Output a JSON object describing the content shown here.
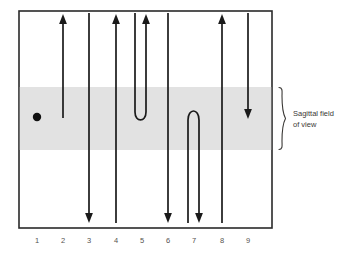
{
  "figure": {
    "background_color": "#ffffff",
    "frame": {
      "x": 19,
      "y": 11,
      "width": 253,
      "height": 217,
      "border_color": "#2a2a2a",
      "fill_color": "#ffffff"
    },
    "band": {
      "label_line1": "Sagittal field",
      "label_line2": "of view",
      "color": "#e2e2e2",
      "top": 87,
      "bottom": 150
    },
    "marker": {
      "name": "point-marker",
      "color": "#111111",
      "cx": 37,
      "cy": 117,
      "r": 4.2
    },
    "brace": {
      "color": "#3a3835",
      "x": 281,
      "top": 87,
      "bottom": 150
    },
    "axis_numbers": [
      {
        "label": "1",
        "x": 37
      },
      {
        "label": "2",
        "x": 63
      },
      {
        "label": "3",
        "x": 89
      },
      {
        "label": "4",
        "x": 116
      },
      {
        "label": "5",
        "x": 142
      },
      {
        "label": "6",
        "x": 168
      },
      {
        "label": "7",
        "x": 194
      },
      {
        "label": "8",
        "x": 222
      },
      {
        "label": "9",
        "x": 248
      }
    ],
    "axis_numbers_y": 243,
    "trajectories": [
      {
        "id": "1",
        "name": "trajectory-1-point",
        "type": "point",
        "description": "single stationary point inside the sagittal band",
        "x": 37,
        "y": 117
      },
      {
        "id": "2",
        "name": "trajectory-2-up-short",
        "type": "line",
        "description": "upward arrow from inside band to top of frame",
        "x": 63,
        "start_y": 118,
        "end_y": 17,
        "direction": "up",
        "arrow_at": "top"
      },
      {
        "id": "3",
        "name": "trajectory-3-down-full",
        "type": "line",
        "description": "downward arrow spanning full frame height",
        "x": 89,
        "start_y": 14,
        "end_y": 222,
        "direction": "down",
        "arrow_at": "bottom"
      },
      {
        "id": "4",
        "name": "trajectory-4-up-full",
        "type": "line",
        "description": "upward arrow spanning full frame height",
        "x": 116,
        "start_y": 222,
        "end_y": 17,
        "direction": "up",
        "arrow_at": "top"
      },
      {
        "id": "5",
        "name": "trajectory-5-u-turn-down-up",
        "type": "u-turn",
        "description": "descends on left leg, turns inside band, ascends with arrowhead at top",
        "left_x": 135,
        "right_x": 146,
        "top_y": 14,
        "turn_y": 121,
        "direction": "down-then-up",
        "arrow_at": "top-right"
      },
      {
        "id": "6",
        "name": "trajectory-6-down-full",
        "type": "line",
        "description": "downward arrow spanning full frame height",
        "x": 168,
        "start_y": 14,
        "end_y": 222,
        "direction": "down",
        "arrow_at": "bottom"
      },
      {
        "id": "7",
        "name": "trajectory-7-inverted-u-turn-up-down",
        "type": "inverted-u-turn",
        "description": "ascends on left leg, turns inside band, descends with arrowhead at bottom",
        "left_x": 188,
        "right_x": 199,
        "bottom_y": 222,
        "turn_y": 114,
        "direction": "up-then-down",
        "arrow_at": "bottom-right"
      },
      {
        "id": "8",
        "name": "trajectory-8-up-full",
        "type": "line",
        "description": "upward arrow spanning full frame height",
        "x": 222,
        "start_y": 222,
        "end_y": 17,
        "direction": "up",
        "arrow_at": "top"
      },
      {
        "id": "9",
        "name": "trajectory-9-down-short",
        "type": "line",
        "description": "downward arrow from top of frame ending inside band",
        "x": 248,
        "start_y": 14,
        "end_y": 118,
        "direction": "down",
        "arrow_at": "bottom"
      }
    ]
  }
}
